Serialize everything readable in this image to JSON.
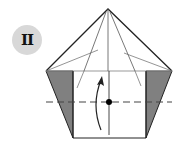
{
  "diagram": {
    "type": "origami-step",
    "step_label": "II",
    "colors": {
      "background": "#ffffff",
      "badge_fill": "#d8d8d8",
      "line": "#222222",
      "crease": "#555555",
      "flap_fill": "#808080",
      "dashed": "#444444",
      "dot": "#000000"
    },
    "elements": [
      "step-badge",
      "pentagon-outline",
      "left-shaded-flap",
      "right-shaded-flap",
      "valley-fold-dashed-line",
      "center-vertical-crease",
      "reference-dot",
      "curved-fold-arrow"
    ]
  }
}
